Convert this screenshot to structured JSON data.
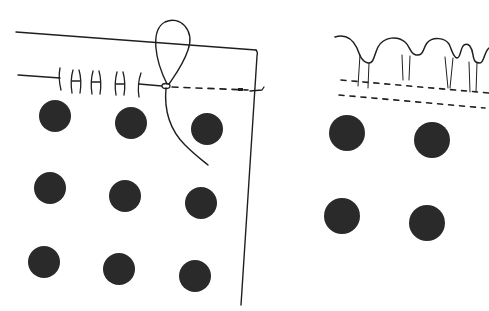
{
  "diagram": {
    "type": "sewing-illustration",
    "colors": {
      "ink": "#1f1f1f",
      "dot_fill": "#2a2a2a",
      "background": "#ffffff"
    },
    "left_panel": {
      "label": "fabric-with-running-stitch",
      "dots": [
        {
          "cx": 55,
          "cy": 116,
          "r": 16
        },
        {
          "cx": 131,
          "cy": 123,
          "r": 16
        },
        {
          "cx": 207,
          "cy": 129,
          "r": 16
        },
        {
          "cx": 50,
          "cy": 188,
          "r": 16
        },
        {
          "cx": 125,
          "cy": 196,
          "r": 16
        },
        {
          "cx": 201,
          "cy": 203,
          "r": 16
        },
        {
          "cx": 44,
          "cy": 262,
          "r": 16
        },
        {
          "cx": 119,
          "cy": 269,
          "r": 16
        },
        {
          "cx": 195,
          "cy": 276,
          "r": 16
        }
      ],
      "stitch_count": 5
    },
    "right_panel": {
      "label": "gathered-fabric",
      "dots": [
        {
          "cx": 347,
          "cy": 133,
          "r": 18
        },
        {
          "cx": 432,
          "cy": 140,
          "r": 18
        },
        {
          "cx": 342,
          "cy": 216,
          "r": 18
        },
        {
          "cx": 427,
          "cy": 223,
          "r": 18
        }
      ],
      "gathers": 4
    }
  }
}
